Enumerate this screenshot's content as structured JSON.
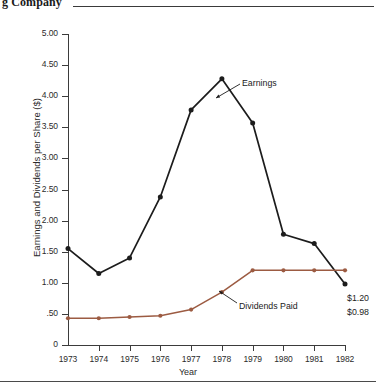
{
  "header": {
    "title_partial": "g Company"
  },
  "chart_data": {
    "type": "line",
    "title": "",
    "xlabel": "Year",
    "ylabel": "Earnings and Dividends per Share ($)",
    "categories": [
      "1973",
      "1974",
      "1975",
      "1976",
      "1977",
      "1978",
      "1979",
      "1980",
      "1981",
      "1982"
    ],
    "x": [
      1973,
      1974,
      1975,
      1976,
      1977,
      1978,
      1979,
      1980,
      1981,
      1982
    ],
    "ylim": [
      0,
      5.0
    ],
    "ytick_labels": [
      "0",
      ".50",
      "1.00",
      "1.50",
      "2.00",
      "2.50",
      "3.00",
      "3.50",
      "4.00",
      "4.50",
      "5.00"
    ],
    "ytick_values": [
      0,
      0.5,
      1.0,
      1.5,
      2.0,
      2.5,
      3.0,
      3.5,
      4.0,
      4.5,
      5.0
    ],
    "grid": false,
    "legend_position": "inline-annotations",
    "series": [
      {
        "name": "Earnings",
        "color": "#1c1c1c",
        "values": [
          1.55,
          1.15,
          1.4,
          2.38,
          3.78,
          4.28,
          3.57,
          1.78,
          1.63,
          0.98
        ]
      },
      {
        "name": "Dividends Paid",
        "color": "#9c5b42",
        "values": [
          0.43,
          0.43,
          0.45,
          0.47,
          0.57,
          0.85,
          1.2,
          1.2,
          1.2,
          1.2
        ]
      }
    ],
    "annotations": [
      {
        "name": "earnings-label",
        "text": "Earnings"
      },
      {
        "name": "dividends-label",
        "text": "Dividends Paid"
      },
      {
        "name": "dividends-end-value",
        "text": "$1.20"
      },
      {
        "name": "earnings-end-value",
        "text": "$0.98"
      }
    ]
  }
}
